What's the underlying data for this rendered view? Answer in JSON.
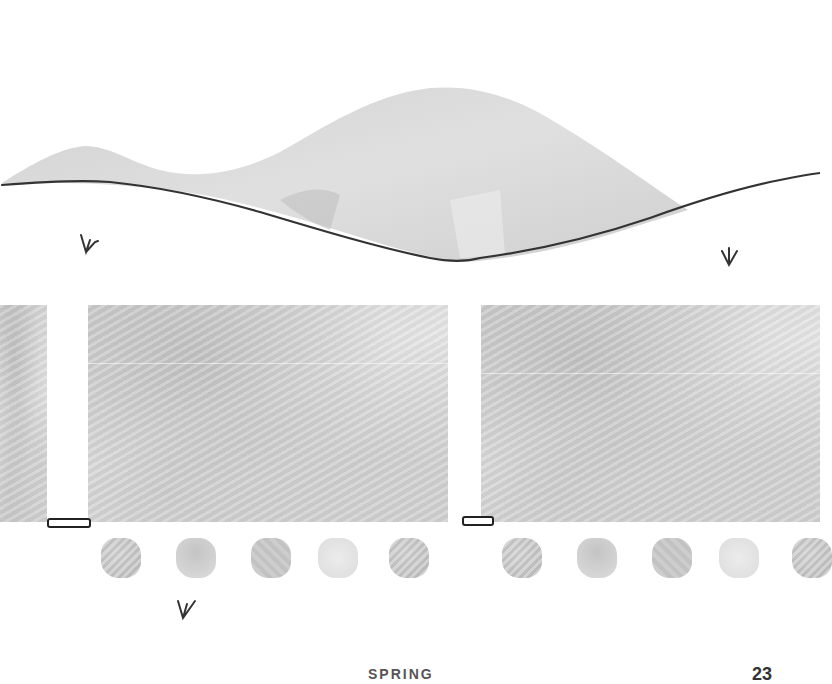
{
  "page": {
    "background": "#ffffff",
    "footer": {
      "title": "SPRING",
      "page_number": "23"
    }
  },
  "illustration": {
    "hills": {
      "fill": "#d4d4d4",
      "outline_color": "#333333"
    },
    "marks": [
      {
        "name": "arrow-mark-left",
        "x": 80,
        "y": 232
      },
      {
        "name": "arrow-mark-right",
        "x": 720,
        "y": 245
      },
      {
        "name": "arrow-mark-bottom",
        "x": 178,
        "y": 597
      }
    ],
    "panels": [
      {
        "name": "panel-left-edge",
        "x": 0,
        "y": 305,
        "w": 47,
        "h": 217
      },
      {
        "name": "panel-left-main",
        "x": 88,
        "y": 305,
        "w": 360,
        "h": 217
      },
      {
        "name": "panel-right-main",
        "x": 481,
        "y": 305,
        "w": 339,
        "h": 217
      }
    ],
    "tab_markers": [
      {
        "name": "tab-marker-left",
        "x": 47,
        "y": 518,
        "w": 40
      },
      {
        "name": "tab-marker-right",
        "x": 462,
        "y": 516,
        "w": 30
      }
    ],
    "swatches_left": [
      "s1",
      "s2",
      "s3",
      "s4",
      "s1"
    ],
    "swatches_right": [
      "s1",
      "s2",
      "s3",
      "s4",
      "s1"
    ]
  }
}
